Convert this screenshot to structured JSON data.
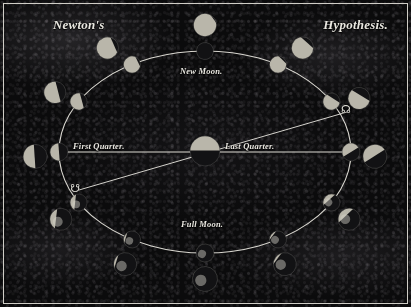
{
  "plate": {
    "title_left": "Newton's",
    "title_right": "Hypothesis.",
    "background_color": "#0b0b0c",
    "ink_color": "#e9e7e0",
    "frame_color": "#cfcdc6"
  },
  "diagram": {
    "labels": {
      "new_moon": "New Moon.",
      "full_moon": "Full Moon.",
      "first_quarter": "First Quarter.",
      "last_quarter": "Last Quarter."
    },
    "nodes": {
      "ascending_symbol": "☊",
      "descending_symbol": "☋"
    },
    "orbit": {
      "center_x": 205,
      "center_y": 152,
      "radius_x": 146,
      "radius_y": 101
    },
    "earth": {
      "center_x": 205,
      "center_y": 151,
      "radius": 15
    },
    "line_of_quarters": {
      "x1": 59,
      "y1": 152,
      "x2": 351,
      "y2": 152
    },
    "line_of_nodes": {
      "x1": 79,
      "y1": 190,
      "x2": 347,
      "y2": 112
    },
    "inner_phases": [
      {
        "name": "new-moon",
        "angle": 270,
        "illumination": 0.0,
        "radius": 8.5
      },
      {
        "name": "waxing-crescent-1",
        "angle": 300,
        "illumination": 0.12,
        "radius": 8.5
      },
      {
        "name": "waxing-crescent-2",
        "angle": 330,
        "illumination": 0.3,
        "radius": 8.5
      },
      {
        "name": "last-quarter",
        "angle": 0,
        "illumination": 0.5,
        "radius": 9.0
      },
      {
        "name": "waxing-gibbous-1",
        "angle": 30,
        "illumination": 0.7,
        "radius": 8.5
      },
      {
        "name": "waxing-gibbous-2",
        "angle": 60,
        "illumination": 0.88,
        "radius": 8.5
      },
      {
        "name": "full-moon",
        "angle": 90,
        "illumination": 1.0,
        "radius": 9.0
      },
      {
        "name": "waning-gibbous-1",
        "angle": 120,
        "illumination": 0.88,
        "radius": 8.5
      },
      {
        "name": "waning-gibbous-2",
        "angle": 150,
        "illumination": 0.7,
        "radius": 8.5
      },
      {
        "name": "first-quarter",
        "angle": 180,
        "illumination": 0.5,
        "radius": 9.0
      },
      {
        "name": "waning-crescent-1",
        "angle": 210,
        "illumination": 0.3,
        "radius": 8.5
      },
      {
        "name": "waning-crescent-2",
        "angle": 240,
        "illumination": 0.12,
        "radius": 8.5
      }
    ],
    "outer_globes": [
      {
        "name": "outer-globe-new",
        "angle": 270,
        "illumination": 0.05,
        "radius": 11.5
      },
      {
        "name": "outer-globe-ne-1",
        "angle": 305,
        "illumination": 0.18,
        "radius": 11.0
      },
      {
        "name": "outer-globe-ne-2",
        "angle": 335,
        "illumination": 0.35,
        "radius": 11.0
      },
      {
        "name": "outer-globe-last-qtr",
        "angle": 2,
        "illumination": 0.52,
        "radius": 12.0
      },
      {
        "name": "outer-globe-se-1",
        "angle": 32,
        "illumination": 0.72,
        "radius": 11.0
      },
      {
        "name": "outer-globe-se-2",
        "angle": 62,
        "illumination": 0.9,
        "radius": 11.5
      },
      {
        "name": "outer-globe-full",
        "angle": 90,
        "illumination": 1.0,
        "radius": 12.5
      },
      {
        "name": "outer-globe-sw-2",
        "angle": 118,
        "illumination": 0.9,
        "radius": 11.5
      },
      {
        "name": "outer-globe-sw-1",
        "angle": 148,
        "illumination": 0.72,
        "radius": 11.0
      },
      {
        "name": "outer-globe-first-qtr",
        "angle": 178,
        "illumination": 0.52,
        "radius": 12.0
      },
      {
        "name": "outer-globe-nw-2",
        "angle": 208,
        "illumination": 0.35,
        "radius": 11.0
      },
      {
        "name": "outer-globe-nw-1",
        "angle": 235,
        "illumination": 0.18,
        "radius": 11.0
      }
    ]
  }
}
